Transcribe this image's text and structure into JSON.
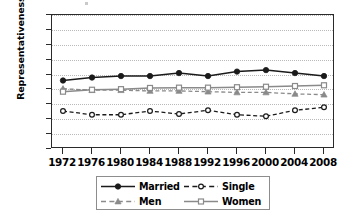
{
  "chart_data": {
    "type": "line",
    "title": "",
    "xlabel": "",
    "ylabel": "Representativeness Ratio",
    "x": [
      1972,
      1976,
      1980,
      1984,
      1988,
      1992,
      1996,
      2000,
      2004,
      2008
    ],
    "xtick_labels": [
      "1972",
      "1976",
      "1980",
      "1984",
      "1988",
      "1992",
      "1996",
      "2000",
      "2004",
      "2008"
    ],
    "ytick_labels": [
      "1.5",
      "1.4",
      "1.3",
      "1.2",
      "1.1",
      "1.0",
      "0.9",
      "0.8",
      "0.7",
      "0.6"
    ],
    "ytick_values": [
      1.5,
      1.4,
      1.3,
      1.2,
      1.1,
      1.0,
      0.9,
      0.8,
      0.7,
      0.6
    ],
    "ylim": [
      0.6,
      1.5
    ],
    "xlim": [
      1972,
      2008
    ],
    "grid": true,
    "grid_axis": "y",
    "legend_position": "bottom",
    "series": [
      {
        "name": "Married",
        "values": [
          1.06,
          1.08,
          1.09,
          1.09,
          1.11,
          1.09,
          1.12,
          1.13,
          1.11,
          1.09
        ],
        "color": "#1a1a1a",
        "linestyle": "solid",
        "marker": "filled-circle"
      },
      {
        "name": "Single",
        "values": [
          0.855,
          0.83,
          0.83,
          0.855,
          0.835,
          0.86,
          0.83,
          0.82,
          0.86,
          0.88
        ],
        "color": "#1a1a1a",
        "linestyle": "dashed",
        "marker": "open-circle"
      },
      {
        "name": "Men",
        "values": [
          1.005,
          0.995,
          0.995,
          0.99,
          0.99,
          0.985,
          0.98,
          0.98,
          0.97,
          0.965
        ],
        "color": "#8a8a8a",
        "linestyle": "dashed",
        "marker": "filled-triangle"
      },
      {
        "name": "Women",
        "values": [
          0.985,
          0.998,
          1.002,
          1.01,
          1.012,
          1.012,
          1.015,
          1.018,
          1.023,
          1.028
        ],
        "color": "#8a8a8a",
        "linestyle": "solid",
        "marker": "open-square"
      }
    ]
  }
}
